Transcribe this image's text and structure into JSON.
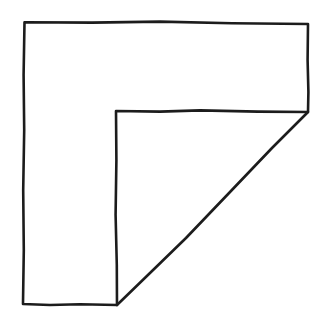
{
  "canvas": {
    "width": 326,
    "height": 323,
    "background_color": "#ffffff",
    "description": "Hand-drawn black ink outline of an L-shaped polygon with a diagonal hypotenuse"
  },
  "figure": {
    "name": "l-shaped-polygon-with-diagonal",
    "style": "hand-drawn ink line art, no fill",
    "stroke_color": "#1c1c1c",
    "stroke_width": 2.6,
    "fill": "none",
    "vertices": [
      {
        "label": "top-left",
        "x": 24,
        "y": 22
      },
      {
        "label": "top-right",
        "x": 308,
        "y": 24
      },
      {
        "label": "right-notch",
        "x": 308,
        "y": 112
      },
      {
        "label": "inner-corner",
        "x": 116,
        "y": 111
      },
      {
        "label": "bottom-inner-vertex",
        "x": 117,
        "y": 305
      },
      {
        "label": "bottom-left",
        "x": 23,
        "y": 304
      }
    ],
    "edges": [
      {
        "name": "top-edge",
        "from": "top-left",
        "to": "top-right",
        "orientation": "horizontal"
      },
      {
        "name": "right-upper-edge",
        "from": "top-right",
        "to": "right-notch",
        "orientation": "vertical"
      },
      {
        "name": "diagonal-hypotenuse",
        "from": "right-notch",
        "to": "bottom-inner-vertex",
        "orientation": "diagonal"
      },
      {
        "name": "inner-top-edge",
        "from": "right-notch",
        "to": "inner-corner",
        "orientation": "horizontal"
      },
      {
        "name": "inner-vertical-edge",
        "from": "inner-corner",
        "to": "bottom-inner-vertex",
        "orientation": "vertical"
      },
      {
        "name": "bottom-edge",
        "from": "bottom-inner-vertex",
        "to": "bottom-left",
        "orientation": "horizontal"
      },
      {
        "name": "left-edge",
        "from": "bottom-left",
        "to": "top-left",
        "orientation": "vertical"
      }
    ],
    "path_outline": "M 24.5 22.2 L 92 22.6 L 160 21.6 L 232 23.2 L 308 24.0 L 307.6 60 L 308.4 92 L 308 112 L 258 111.6 L 200 110.4 L 160 111.6 L 116 111.0 L 116.4 160 L 115.6 215 L 116.8 265 L 117.0 305.0 L 80 304.2 L 50 305.0 L 23.0 304.0 L 23.8 250 L 23.2 190 L 24.2 130 L 23.6 75 L 24.5 22.2 Z",
    "path_diagonal": "M 308 112 L 272 148 L 230 192 L 186 238 L 150 273 L 117 305"
  }
}
